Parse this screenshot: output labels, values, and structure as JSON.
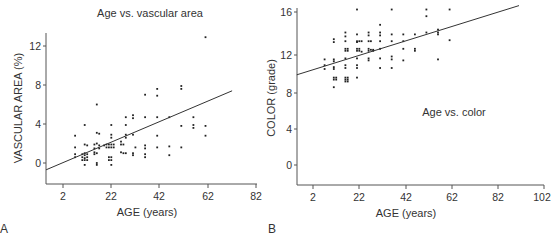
{
  "chart_data": [
    {
      "panel": "A",
      "type": "scatter",
      "title": "Age vs. vascular area",
      "xlabel": "AGE (years)",
      "ylabel": "VASCULAR AREA (%)",
      "xticks": [
        2,
        22,
        42,
        62,
        82
      ],
      "yticks": [
        0,
        4,
        8,
        12
      ],
      "xlim": [
        -5,
        82
      ],
      "ylim": [
        -2,
        13.5
      ],
      "grid": false,
      "legend": null,
      "regression_line": {
        "x": [
          -5,
          72
        ],
        "y": [
          -0.7,
          7.4
        ]
      },
      "points": [
        [
          7,
          2.8
        ],
        [
          7,
          1.6
        ],
        [
          7,
          0.9
        ],
        [
          7,
          0.6
        ],
        [
          11,
          3.9
        ],
        [
          11,
          1.9
        ],
        [
          11,
          1.0
        ],
        [
          11,
          0.8
        ],
        [
          11,
          0.5
        ],
        [
          11,
          0.3
        ],
        [
          11,
          -0.2
        ],
        [
          10,
          0.9
        ],
        [
          10,
          0.6
        ],
        [
          10,
          0.3
        ],
        [
          12,
          0.9
        ],
        [
          12,
          0.6
        ],
        [
          12,
          0.3
        ],
        [
          12,
          1.8
        ],
        [
          15,
          1.9
        ],
        [
          15,
          1.5
        ],
        [
          15,
          1.1
        ],
        [
          15,
          0.9
        ],
        [
          16,
          6.0
        ],
        [
          16,
          3.1
        ],
        [
          16,
          2.0
        ],
        [
          16,
          1.0
        ],
        [
          16,
          0.0
        ],
        [
          16,
          -0.2
        ],
        [
          17,
          3.0
        ],
        [
          17,
          1.8
        ],
        [
          17,
          1.5
        ],
        [
          19,
          1.8
        ],
        [
          20,
          1.9
        ],
        [
          20,
          1.6
        ],
        [
          21,
          1.9
        ],
        [
          21,
          1.6
        ],
        [
          21,
          0.6
        ],
        [
          21,
          0.3
        ],
        [
          22,
          3.9
        ],
        [
          22,
          2.9
        ],
        [
          22,
          2.6
        ],
        [
          22,
          1.9
        ],
        [
          22,
          1.6
        ],
        [
          22,
          0.6
        ],
        [
          22,
          0.3
        ],
        [
          22,
          -0.2
        ],
        [
          23,
          1.9
        ],
        [
          23,
          1.6
        ],
        [
          26,
          2.2
        ],
        [
          26,
          1.9
        ],
        [
          26,
          1.1
        ],
        [
          27,
          1.9
        ],
        [
          27,
          1.0
        ],
        [
          28,
          4.7
        ],
        [
          28,
          3.9
        ],
        [
          28,
          2.9
        ],
        [
          28,
          2.6
        ],
        [
          28,
          1.0
        ],
        [
          31,
          4.9
        ],
        [
          31,
          4.6
        ],
        [
          31,
          2.9
        ],
        [
          31,
          1.0
        ],
        [
          31,
          0.8
        ],
        [
          32,
          1.6
        ],
        [
          36,
          7.0
        ],
        [
          36,
          4.7
        ],
        [
          36,
          1.8
        ],
        [
          36,
          1.5
        ],
        [
          36,
          0.9
        ],
        [
          36,
          0.6
        ],
        [
          41,
          7.6
        ],
        [
          41,
          6.9
        ],
        [
          41,
          4.7
        ],
        [
          41,
          2.8
        ],
        [
          41,
          1.6
        ],
        [
          46,
          4.7
        ],
        [
          46,
          1.7
        ],
        [
          46,
          0.8
        ],
        [
          51,
          7.9
        ],
        [
          51,
          7.6
        ],
        [
          51,
          3.8
        ],
        [
          51,
          1.6
        ],
        [
          56,
          4.7
        ],
        [
          56,
          3.9
        ],
        [
          56,
          3.6
        ],
        [
          61,
          12.9
        ],
        [
          61,
          3.8
        ],
        [
          61,
          2.8
        ]
      ]
    },
    {
      "panel": "B",
      "type": "scatter",
      "title": "Age vs. color",
      "xlabel": "AGE (years)",
      "ylabel": "COLOR (grade)",
      "xticks": [
        2,
        22,
        42,
        62,
        82,
        102
      ],
      "yticks": [
        0,
        4,
        8,
        12,
        16
      ],
      "xlim": [
        -5,
        102
      ],
      "ylim": [
        -2,
        17
      ],
      "grid": false,
      "legend": null,
      "regression_line": {
        "x": [
          -5,
          91
        ],
        "y": [
          9.4,
          16.6
        ]
      },
      "points": [
        [
          7,
          11
        ],
        [
          7,
          10.4
        ],
        [
          7,
          10
        ],
        [
          11,
          13.1
        ],
        [
          11,
          12.8
        ],
        [
          11,
          11
        ],
        [
          11,
          10.8
        ],
        [
          11,
          10.2
        ],
        [
          11,
          10
        ],
        [
          11,
          9.1
        ],
        [
          11,
          8.9
        ],
        [
          11,
          8.1
        ],
        [
          12,
          9.1
        ],
        [
          12,
          8.9
        ],
        [
          16,
          13.8
        ],
        [
          16,
          13.4
        ],
        [
          16,
          12.9
        ],
        [
          16,
          12.1
        ],
        [
          16,
          11.9
        ],
        [
          16,
          11.1
        ],
        [
          16,
          10.4
        ],
        [
          16,
          10.1
        ],
        [
          16,
          9.1
        ],
        [
          16,
          8.9
        ],
        [
          16,
          8.7
        ],
        [
          17,
          12.1
        ],
        [
          17,
          11.9
        ],
        [
          17,
          9.1
        ],
        [
          17,
          8.9
        ],
        [
          17,
          8.7
        ],
        [
          21,
          16.2
        ],
        [
          21,
          13.6
        ],
        [
          21,
          12.9
        ],
        [
          21,
          12.8
        ],
        [
          21,
          12.1
        ],
        [
          21,
          11.9
        ],
        [
          21,
          11.1
        ],
        [
          21,
          10.4
        ],
        [
          21,
          10.1
        ],
        [
          21,
          9.1
        ],
        [
          22,
          12.9
        ],
        [
          22,
          12.1
        ],
        [
          22,
          11.9
        ],
        [
          23,
          12.9
        ],
        [
          23,
          11.8
        ],
        [
          26,
          13.8
        ],
        [
          26,
          13.5
        ],
        [
          26,
          12.9
        ],
        [
          26,
          12.1
        ],
        [
          26,
          11.9
        ],
        [
          26,
          11.1
        ],
        [
          26,
          10.9
        ],
        [
          27,
          12.9
        ],
        [
          27,
          12
        ],
        [
          28,
          12
        ],
        [
          28,
          11.9
        ],
        [
          31,
          14.6
        ],
        [
          31,
          13.8
        ],
        [
          31,
          13.5
        ],
        [
          31,
          12.9
        ],
        [
          31,
          12.1
        ],
        [
          31,
          11.1
        ],
        [
          31,
          10.1
        ],
        [
          36,
          16.2
        ],
        [
          36,
          13.6
        ],
        [
          36,
          12.9
        ],
        [
          36,
          11.3
        ],
        [
          36,
          11
        ],
        [
          36,
          10.1
        ],
        [
          41,
          13.6
        ],
        [
          41,
          12.9
        ],
        [
          41,
          12.1
        ],
        [
          41,
          10.9
        ],
        [
          46,
          13.6
        ],
        [
          46,
          12.1
        ],
        [
          46,
          11.9
        ],
        [
          51,
          17.3
        ],
        [
          51,
          16.2
        ],
        [
          51,
          15.5
        ],
        [
          51,
          13.8
        ],
        [
          56,
          14.1
        ],
        [
          56,
          13.8
        ],
        [
          56,
          13.6
        ],
        [
          56,
          11
        ],
        [
          61,
          17.4
        ],
        [
          61,
          16.2
        ],
        [
          61,
          13
        ]
      ]
    }
  ],
  "panels": {
    "a": {
      "letter": "A",
      "title": "Age vs. vascular area",
      "xlabel": "AGE (years)",
      "ylabel": "VASCULAR AREA (%)",
      "xtick_labels": [
        "2",
        "22",
        "42",
        "62",
        "82"
      ],
      "ytick_labels": [
        "12",
        "8",
        "4",
        "0"
      ]
    },
    "b": {
      "letter": "B",
      "title": "Age vs. color",
      "xlabel": "AGE (years)",
      "ylabel": "COLOR (grade)",
      "xtick_labels": [
        "2",
        "22",
        "42",
        "62",
        "82",
        "102"
      ],
      "ytick_labels": [
        "16",
        "12",
        "8",
        "4",
        "0"
      ]
    }
  },
  "colors": {
    "axis": "#555555",
    "point": "#222222",
    "line": "#333333",
    "text": "#333333"
  }
}
